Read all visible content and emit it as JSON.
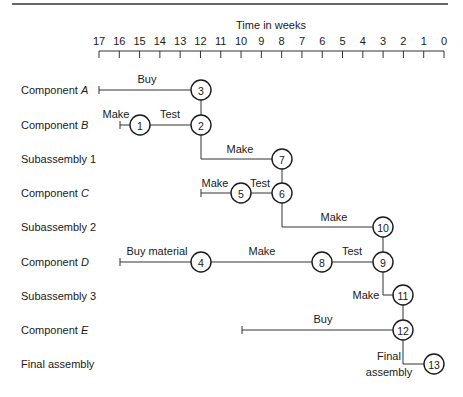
{
  "axis": {
    "title": "Time in weeks",
    "ticks": [
      "17",
      "16",
      "15",
      "14",
      "13",
      "12",
      "11",
      "10",
      "9",
      "8",
      "7",
      "6",
      "5",
      "4",
      "3",
      "2",
      "1",
      "0"
    ]
  },
  "rows": [
    {
      "label": "Component ",
      "italic": "A"
    },
    {
      "label": "Component ",
      "italic": "B"
    },
    {
      "label": "Subassembly 1",
      "italic": ""
    },
    {
      "label": "Component ",
      "italic": "C"
    },
    {
      "label": "Subassembly 2",
      "italic": ""
    },
    {
      "label": "Component ",
      "italic": "D"
    },
    {
      "label": "Subassembly 3",
      "italic": ""
    },
    {
      "label": "Component ",
      "italic": "E"
    },
    {
      "label": "Final assembly",
      "italic": ""
    }
  ],
  "nodes": [
    "1",
    "2",
    "3",
    "4",
    "5",
    "6",
    "7",
    "8",
    "9",
    "10",
    "11",
    "12",
    "13"
  ],
  "activities": {
    "a_buy": "Buy",
    "b_make": "Make",
    "b_test": "Test",
    "s1_make": "Make",
    "c_make": "Make",
    "c_test": "Test",
    "s2_make": "Make",
    "d_buy": "Buy material",
    "d_make": "Make",
    "d_test": "Test",
    "s3_make": "Make",
    "e_buy": "Buy",
    "final_1": "Final",
    "final_2": "assembly"
  },
  "chart_data": {
    "type": "gantt-network",
    "title": "Time in weeks",
    "xlabel": "Time in weeks",
    "xlim": [
      17,
      0
    ],
    "rows": [
      "Component A",
      "Component B",
      "Subassembly 1",
      "Component C",
      "Subassembly 2",
      "Component D",
      "Subassembly 3",
      "Component E",
      "Final assembly"
    ],
    "activities": [
      {
        "row": "Component A",
        "name": "Buy",
        "start_week": 17,
        "end_week": 12,
        "end_node": 3
      },
      {
        "row": "Component B",
        "name": "Make",
        "start_week": 16,
        "end_week": 15,
        "end_node": 1
      },
      {
        "row": "Component B",
        "name": "Test",
        "start_week": 15,
        "end_week": 12,
        "start_node": 1,
        "end_node": 2
      },
      {
        "row": "Subassembly 1",
        "name": "Make",
        "start_week": 12,
        "end_week": 8,
        "start_node": 2,
        "end_node": 7
      },
      {
        "row": "Component C",
        "name": "Make",
        "start_week": 12,
        "end_week": 10,
        "end_node": 5
      },
      {
        "row": "Component C",
        "name": "Test",
        "start_week": 10,
        "end_week": 8,
        "start_node": 5,
        "end_node": 6
      },
      {
        "row": "Subassembly 2",
        "name": "Make",
        "start_week": 8,
        "end_week": 3,
        "start_node": 6,
        "end_node": 10
      },
      {
        "row": "Component D",
        "name": "Buy material",
        "start_week": 16,
        "end_week": 12,
        "end_node": 4
      },
      {
        "row": "Component D",
        "name": "Make",
        "start_week": 12,
        "end_week": 6,
        "start_node": 4,
        "end_node": 8
      },
      {
        "row": "Component D",
        "name": "Test",
        "start_week": 6,
        "end_week": 3,
        "start_node": 8,
        "end_node": 9
      },
      {
        "row": "Subassembly 3",
        "name": "Make",
        "start_week": 3,
        "end_week": 2,
        "start_node": 9,
        "end_node": 11
      },
      {
        "row": "Component E",
        "name": "Buy",
        "start_week": 10,
        "end_week": 2,
        "end_node": 12
      },
      {
        "row": "Final assembly",
        "name": "Final assembly",
        "start_week": 2,
        "end_week": 0.5,
        "start_node": 12,
        "end_node": 13
      }
    ],
    "links": [
      [
        3,
        2
      ],
      [
        7,
        6
      ],
      [
        10,
        9
      ],
      [
        11,
        12
      ]
    ]
  }
}
